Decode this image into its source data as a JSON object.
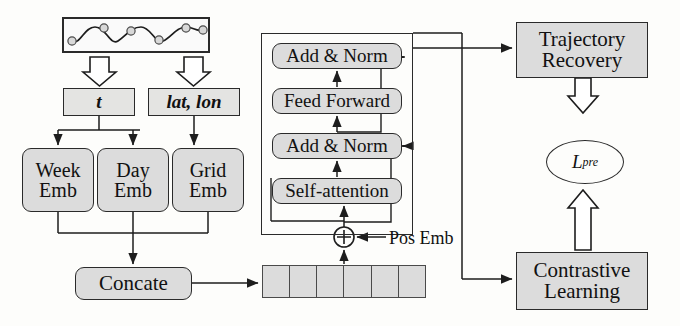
{
  "figure": {
    "type": "flow-diagram",
    "background": "#fdfdfb",
    "box_fill": "#dcdcdc",
    "stroke": "#2a2a2a"
  },
  "input": {
    "trajectory_label": "trajectory-curve",
    "node_count": 6,
    "curve_nodes": [
      {
        "x": 10,
        "y": 24
      },
      {
        "x": 37,
        "y": 12
      },
      {
        "x": 64,
        "y": 24
      },
      {
        "x": 91,
        "y": 12
      },
      {
        "x": 118,
        "y": 24
      },
      {
        "x": 140,
        "y": 12
      }
    ]
  },
  "features": {
    "time": "t",
    "location": "lat, lon"
  },
  "embeddings": [
    {
      "name": "week-emb",
      "line1": "Week",
      "line2": "Emb"
    },
    {
      "name": "day-emb",
      "line1": "Day",
      "line2": "Emb"
    },
    {
      "name": "grid-emb",
      "line1": "Grid",
      "line2": "Emb"
    }
  ],
  "concat": {
    "label": "Concate"
  },
  "tokens": {
    "cell_count": 6,
    "label": "token-embedding-sequence"
  },
  "pos_emb": {
    "label": "Pos Emb",
    "operator": "⊕"
  },
  "transformer": {
    "blocks": [
      {
        "name": "add-norm-upper",
        "label": "Add & Norm"
      },
      {
        "name": "feed-forward",
        "label": "Feed Forward"
      },
      {
        "name": "add-norm-lower",
        "label": "Add & Norm"
      },
      {
        "name": "self-attention",
        "label": "Self-attention"
      }
    ]
  },
  "tasks": {
    "trajectory_recovery": {
      "line1": "Trajectory",
      "line2": "Recovery"
    },
    "contrastive_learning": {
      "line1": "Contrastive",
      "line2": "Learning"
    }
  },
  "loss": {
    "symbol": "L",
    "subscript": "pre"
  }
}
